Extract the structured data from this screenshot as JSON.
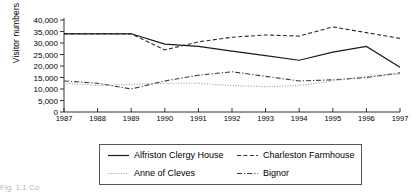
{
  "chart_data": {
    "type": "line",
    "title": "",
    "xlabel": "",
    "ylabel": "Visitor numbers",
    "x": [
      1987,
      1988,
      1989,
      1990,
      1991,
      1992,
      1993,
      1994,
      1995,
      1996,
      1997
    ],
    "categories": [
      "1987",
      "1988",
      "1989",
      "1990",
      "1991",
      "1992",
      "1993",
      "1994",
      "1995",
      "1996",
      "1997"
    ],
    "ylim": [
      0,
      40000
    ],
    "xlim": [
      1987,
      1997
    ],
    "yticks": [
      0,
      5000,
      10000,
      15000,
      20000,
      25000,
      30000,
      35000,
      40000
    ],
    "ytick_labels": [
      "0",
      "5,000",
      "10,000",
      "15,000",
      "20,000",
      "25,000",
      "30,000",
      "35,000",
      "40,000"
    ],
    "grid": false,
    "legend_position": "bottom",
    "series": [
      {
        "name": "Alfriston Clergy House",
        "style": "solid",
        "color": "#1a1a1a",
        "values": [
          34000,
          34000,
          34000,
          29500,
          28500,
          26500,
          24500,
          22500,
          26000,
          28500,
          19500
        ]
      },
      {
        "name": "Anne of Cleves",
        "style": "dotted",
        "color": "#9a9a9a",
        "values": [
          12500,
          11500,
          12000,
          12500,
          12500,
          11500,
          11000,
          11500,
          13500,
          15500,
          16500
        ]
      },
      {
        "name": "Charleston Farmhouse",
        "style": "dashed",
        "color": "#2b2b2b",
        "values": [
          34000,
          34000,
          34000,
          27000,
          30500,
          32500,
          33500,
          33000,
          37000,
          34500,
          32000
        ]
      },
      {
        "name": "Bignor",
        "style": "dashdot",
        "color": "#3a3a3a",
        "values": [
          13500,
          12500,
          10000,
          13500,
          16000,
          17500,
          15500,
          13500,
          14000,
          15000,
          17000
        ]
      }
    ]
  },
  "axis": {
    "ylabel": "Visitor numbers",
    "ytick_labels": [
      "40,000",
      "35,000",
      "30,000",
      "25,000",
      "20,000",
      "15,000",
      "10,000",
      "5,000",
      "0"
    ],
    "xtick_labels": [
      "1987",
      "1988",
      "1989",
      "1990",
      "1991",
      "1992",
      "1993",
      "1994",
      "1995",
      "1996",
      "1997"
    ]
  },
  "legend": {
    "entries": [
      {
        "label": "Alfriston Clergy House",
        "style": "solid"
      },
      {
        "label": "Charleston Farmhouse",
        "style": "dashed"
      },
      {
        "label": "Anne of Cleves",
        "style": "dotted"
      },
      {
        "label": "Bignor",
        "style": "dashdot"
      }
    ]
  },
  "caption": {
    "fragment": "Fig. 1.1   Co"
  }
}
